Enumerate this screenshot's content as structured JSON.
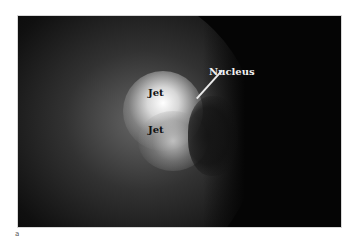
{
  "figure": {
    "panel_letter": "a",
    "annotations": {
      "jet_upper": "Jet",
      "jet_lower": "Jet",
      "nucleus": "Nucleus"
    },
    "colors": {
      "background": "#050505",
      "jet_glow": "#ffffff",
      "nucleus_label": "#f2f2f2",
      "jet_label": "#111111"
    }
  }
}
